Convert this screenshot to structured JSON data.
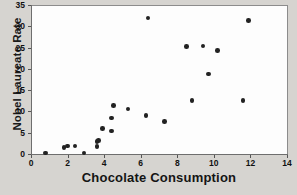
{
  "chart_data": {
    "type": "scatter",
    "title": "",
    "xlabel": "Chocolate Consumption",
    "ylabel": "Nobel Laureate Rate",
    "xlim": [
      0,
      14
    ],
    "ylim": [
      0,
      35
    ],
    "xticks": [
      0,
      2,
      4,
      6,
      8,
      10,
      12,
      14
    ],
    "yticks": [
      0,
      5,
      10,
      15,
      20,
      25,
      30,
      35
    ],
    "grid": false,
    "legend": null,
    "marker": "filled-circle",
    "marker_color": "#222222",
    "background_color": "#d6d4d0",
    "plot_background_color": "#fdfdfd",
    "points": [
      {
        "x": 0.8,
        "y": 0.2
      },
      {
        "x": 1.8,
        "y": 1.5
      },
      {
        "x": 2.0,
        "y": 1.9
      },
      {
        "x": 2.4,
        "y": 1.9
      },
      {
        "x": 2.9,
        "y": 0.2
      },
      {
        "x": 3.6,
        "y": 1.7
      },
      {
        "x": 3.6,
        "y": 3.0
      },
      {
        "x": 3.7,
        "y": 3.2
      },
      {
        "x": 3.9,
        "y": 6.0
      },
      {
        "x": 4.4,
        "y": 5.4
      },
      {
        "x": 4.4,
        "y": 8.5
      },
      {
        "x": 4.5,
        "y": 11.4
      },
      {
        "x": 5.3,
        "y": 10.6
      },
      {
        "x": 6.4,
        "y": 31.9
      },
      {
        "x": 6.3,
        "y": 9.0
      },
      {
        "x": 7.3,
        "y": 7.6
      },
      {
        "x": 8.5,
        "y": 25.3
      },
      {
        "x": 8.8,
        "y": 12.6
      },
      {
        "x": 9.4,
        "y": 25.4
      },
      {
        "x": 9.7,
        "y": 18.8
      },
      {
        "x": 10.2,
        "y": 24.3
      },
      {
        "x": 11.6,
        "y": 12.6
      },
      {
        "x": 11.9,
        "y": 31.4
      }
    ]
  }
}
